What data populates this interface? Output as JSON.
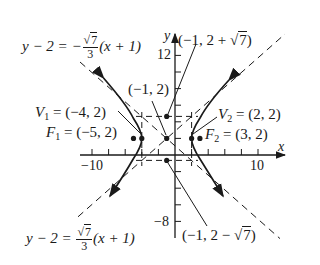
{
  "figure": {
    "type": "hyperbola-graph",
    "equation": "(x+1)^2/9 - (y-2)^2/7 = 1",
    "center": {
      "label": "(−1, 2)",
      "x": -1,
      "y": 2
    },
    "vertices": [
      {
        "name": "V",
        "sub": "1",
        "label": "(−4, 2)",
        "x": -4,
        "y": 2
      },
      {
        "name": "V",
        "sub": "2",
        "label": "(2, 2)",
        "x": 2,
        "y": 2
      }
    ],
    "foci": [
      {
        "name": "F",
        "sub": "1",
        "label": "(−5, 2)",
        "x": -5,
        "y": 2
      },
      {
        "name": "F",
        "sub": "2",
        "label": "(3, 2)",
        "x": 3,
        "y": 2
      }
    ],
    "conjugate_points": {
      "top": {
        "prefix": "(−1, 2 + ",
        "radical": "7",
        "suffix": ")"
      },
      "bottom": {
        "prefix": "(−1, 2 − ",
        "radical": "7",
        "suffix": ")"
      }
    },
    "asymptotes": {
      "upper": {
        "lhs": "y − 2 = −",
        "num_radical": "7",
        "den": "3",
        "rhs": "(x + 1)"
      },
      "lower": {
        "lhs": "y − 2 = ",
        "num_radical": "7",
        "den": "3",
        "rhs": "(x + 1)"
      }
    },
    "axes": {
      "x_label": "x",
      "y_label": "y",
      "x_ticks_labeled": [
        "−10",
        "10"
      ],
      "y_ticks_labeled": [
        "12",
        "−8"
      ],
      "x_range": [
        -11,
        13
      ],
      "y_range": [
        -10,
        14
      ]
    },
    "colors": {
      "ink": "#1a1a1a",
      "background": "#ffffff"
    }
  }
}
